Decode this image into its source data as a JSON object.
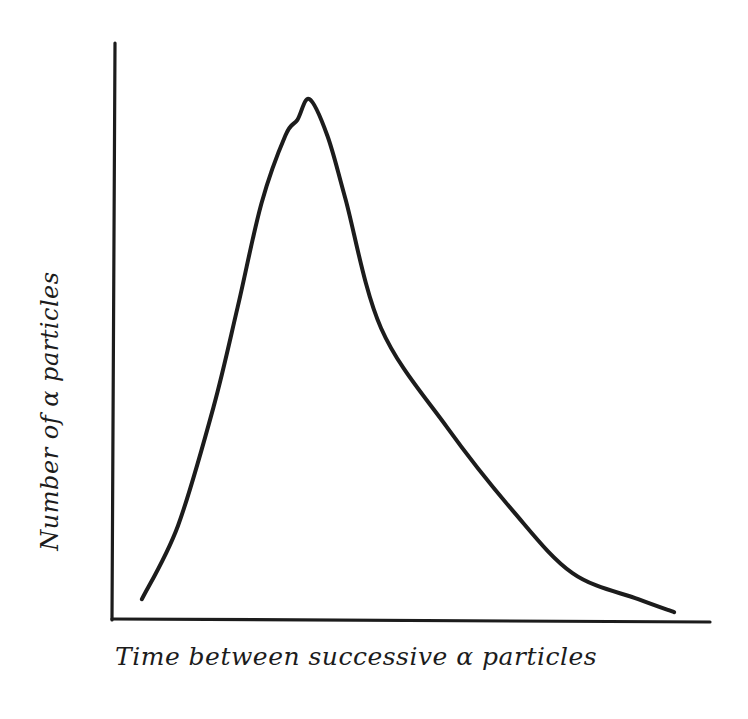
{
  "chart_data": {
    "type": "line",
    "title": "",
    "xlabel": "Time between successive α particles",
    "ylabel": "Number of α particles",
    "grid": false,
    "legend": null,
    "ticks": {
      "x": [],
      "y": []
    },
    "style": "hand-drawn",
    "series": [
      {
        "name": "distribution",
        "x": [
          0.05,
          0.11,
          0.17,
          0.21,
          0.25,
          0.29,
          0.31,
          0.33,
          0.36,
          0.39,
          0.45,
          0.56,
          0.67,
          0.77,
          0.88,
          0.94
        ],
        "y": [
          0.04,
          0.18,
          0.41,
          0.6,
          0.8,
          0.93,
          0.96,
          1.0,
          0.93,
          0.81,
          0.56,
          0.37,
          0.21,
          0.09,
          0.04,
          0.015
        ]
      }
    ],
    "xlim": [
      0,
      1
    ],
    "ylim": [
      0,
      1.1
    ],
    "pixel_geometry": {
      "origin": [
        112,
        620
      ],
      "y_axis_top": [
        115,
        43
      ],
      "x_axis_end": [
        710,
        622
      ],
      "peak": [
        296,
        99
      ],
      "curve_start": [
        140,
        595
      ],
      "curve_end": [
        667,
        610
      ]
    },
    "colors": {
      "ink": "#1c1c1c",
      "background": "#ffffff"
    }
  }
}
